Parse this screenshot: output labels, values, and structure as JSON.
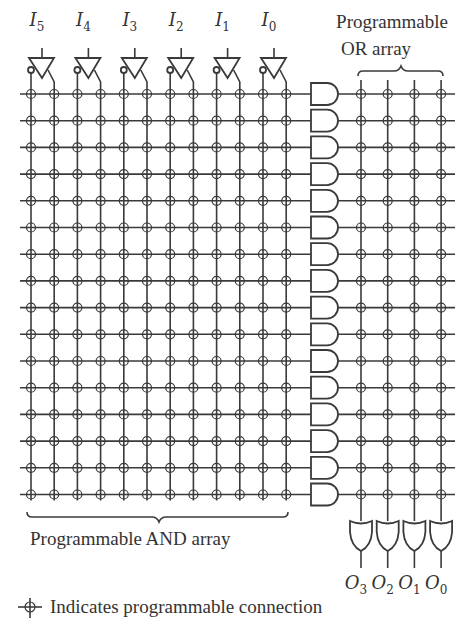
{
  "inputs": [
    {
      "name": "I",
      "sub": "5"
    },
    {
      "name": "I",
      "sub": "4"
    },
    {
      "name": "I",
      "sub": "3"
    },
    {
      "name": "I",
      "sub": "2"
    },
    {
      "name": "I",
      "sub": "1"
    },
    {
      "name": "I",
      "sub": "0"
    }
  ],
  "outputs": [
    {
      "name": "O",
      "sub": "3"
    },
    {
      "name": "O",
      "sub": "2"
    },
    {
      "name": "O",
      "sub": "1"
    },
    {
      "name": "O",
      "sub": "0"
    }
  ],
  "labels": {
    "or_array_line1": "Programmable",
    "or_array_line2": "OR array",
    "and_array": "Programmable AND array",
    "legend": "Indicates programmable connection"
  },
  "structure": {
    "input_count": 6,
    "input_lines": 12,
    "product_terms": 16,
    "output_count": 4,
    "and_gates": 16,
    "or_gates": 4
  },
  "colors": {
    "line": "#3a3a3a",
    "text": "#333333",
    "background": "#ffffff"
  }
}
